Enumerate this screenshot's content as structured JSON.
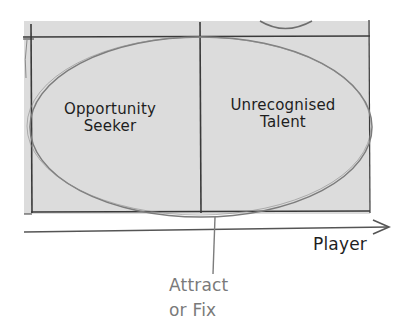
{
  "diagram": {
    "type": "quadrant-sketch",
    "style": "hand-drawn",
    "colors": {
      "background": "#ffffff",
      "panel_fill": "#dcdcdc",
      "grid_line": "#3a3a3a",
      "ellipse_stroke": "#7c7c7c",
      "axis_line": "#555555",
      "text_primary": "#1e1e1e",
      "text_annotation": "#7a7a7a"
    },
    "quadrants": [
      {
        "id": "opportunity-seeker",
        "label": "Opportunity\nSeeker"
      },
      {
        "id": "unrecognised-talent",
        "label": "Unrecognised\nTalent"
      }
    ],
    "x_axis": {
      "label": "Player"
    },
    "highlight": {
      "shape": "ellipse",
      "annotation": "Attract\nor Fix"
    }
  }
}
